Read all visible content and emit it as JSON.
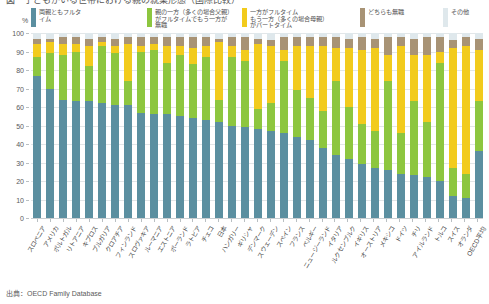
{
  "title_partial": "図　子どもがいる世帯における親の就業形態（国際比較）",
  "axis": {
    "unit_symbol": "%",
    "y_ticks": [
      100,
      90,
      80,
      70,
      60,
      50,
      40,
      30,
      20,
      10,
      0
    ],
    "ylim": [
      0,
      100
    ]
  },
  "legend": [
    {
      "label": "両親ともフルタ\nイム",
      "color": "#5b8fa0"
    },
    {
      "label": "親の一方（多くの場合父親）\nがフルタイムでもう一方が\n無職",
      "color": "#8dc63f"
    },
    {
      "label": "一方がフルタイム\nもう一方（多くの場合母親）\nがパートタイム",
      "color": "#f2cb1d"
    },
    {
      "label": "どちらも無職",
      "color": "#a89375"
    },
    {
      "label": "その他",
      "color": "#dfe8ec"
    }
  ],
  "source": "出典：OECD Family Database",
  "chart_data": {
    "type": "bar",
    "subtype": "stacked-100-percent",
    "title": "",
    "xlabel": "",
    "ylabel": "%",
    "ylim": [
      0,
      100
    ],
    "grid": true,
    "legend_position": "top",
    "categories": [
      "スロベニア",
      "アメリカ",
      "ポルトガル",
      "リトアニア",
      "キプロス",
      "ブルガリア",
      "クロアチア",
      "フィンランド",
      "スロヴァキア",
      "ルーマニア",
      "エストニア",
      "ポーランド",
      "ラトビア",
      "チェコ",
      "日本",
      "ハンガリー",
      "ギリシャ",
      "デンマーク",
      "スウェーデン",
      "スペイン",
      "フランス",
      "ベルギー",
      "ニュージーランド",
      "イタリア",
      "ルクセンブルク",
      "イギリス",
      "オーストリア",
      "メキシコ",
      "ドイツ",
      "チリ",
      "アイルランド",
      "トルコ",
      "スイス",
      "オランダ",
      "OECD平均"
    ],
    "series": [
      {
        "name": "両親ともフルタイム",
        "color": "#5b8fa0",
        "values": [
          77,
          70,
          64,
          63,
          63,
          62,
          61,
          61,
          57,
          56,
          56,
          55,
          54,
          53,
          52,
          50,
          49,
          48,
          47,
          46,
          44,
          42,
          38,
          34,
          32,
          29,
          27,
          26,
          24,
          23,
          22,
          20,
          12,
          11,
          36
        ]
      },
      {
        "name": "親の一方がフルタイムでもう一方が無職",
        "color": "#8dc63f",
        "values": [
          10,
          19,
          24,
          27,
          19,
          31,
          28,
          13,
          33,
          35,
          28,
          33,
          29,
          34,
          12,
          37,
          36,
          11,
          15,
          39,
          25,
          23,
          20,
          40,
          28,
          22,
          20,
          48,
          22,
          40,
          30,
          64,
          15,
          13,
          27
        ]
      },
      {
        "name": "一方がフルタイムもう一方がパートタイム",
        "color": "#f2cb1d",
        "values": [
          7,
          6,
          6,
          4,
          11,
          2,
          4,
          20,
          3,
          3,
          9,
          5,
          9,
          6,
          31,
          6,
          6,
          35,
          31,
          6,
          24,
          28,
          35,
          18,
          32,
          40,
          45,
          14,
          47,
          25,
          36,
          6,
          65,
          69,
          28
        ]
      },
      {
        "name": "どちらも無職",
        "color": "#a89375",
        "values": [
          3,
          2,
          4,
          4,
          4,
          3,
          4,
          4,
          5,
          4,
          5,
          5,
          6,
          5,
          2,
          5,
          7,
          3,
          3,
          7,
          5,
          5,
          5,
          6,
          5,
          7,
          5,
          10,
          5,
          9,
          10,
          8,
          4,
          5,
          6
        ]
      },
      {
        "name": "その他",
        "color": "#dfe8ec",
        "values": [
          3,
          3,
          2,
          2,
          3,
          2,
          3,
          2,
          2,
          2,
          2,
          2,
          2,
          2,
          3,
          2,
          2,
          3,
          4,
          2,
          2,
          2,
          2,
          2,
          3,
          2,
          3,
          2,
          2,
          3,
          2,
          2,
          4,
          2,
          3
        ]
      }
    ]
  }
}
